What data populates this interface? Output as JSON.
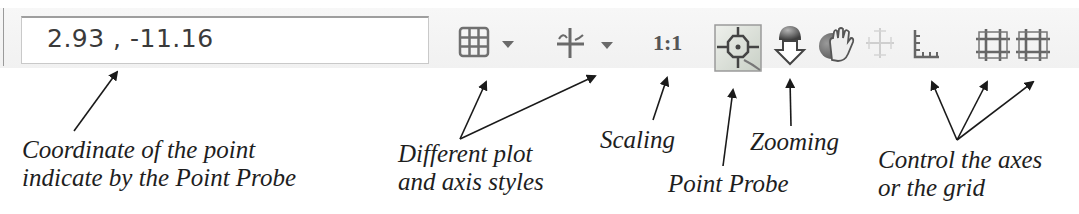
{
  "toolbar": {
    "coordinate_value": "2.93 , -11.16",
    "icons": [
      {
        "name": "plot-style-grid-icon",
        "has_dropdown": true
      },
      {
        "name": "axis-style-icon",
        "has_dropdown": true
      },
      {
        "name": "scaling-1-1-icon",
        "text": "1:1"
      },
      {
        "name": "point-probe-icon",
        "active": true
      },
      {
        "name": "zoom-icon"
      },
      {
        "name": "pan-hand-icon"
      },
      {
        "name": "pan-axes-icon",
        "disabled": true
      },
      {
        "name": "axes-ticks-icon"
      },
      {
        "name": "grid-major-icon"
      },
      {
        "name": "grid-minor-icon"
      }
    ],
    "scaling_text": "1:1"
  },
  "annotations": {
    "coordinate": {
      "line1": "Coordinate of the point",
      "line2": "indicate by the Point Probe"
    },
    "styles": {
      "line1": "Different plot",
      "line2": "and axis styles"
    },
    "scaling": {
      "line1": "Scaling"
    },
    "point_probe": {
      "line1": "Point Probe"
    },
    "zooming": {
      "line1": "Zooming"
    },
    "axes_grid": {
      "line1": "Control the axes",
      "line2": "or the grid"
    }
  },
  "colors": {
    "toolbar_bg": "#f3f3f3",
    "icon_gray": "#6f6f6f",
    "active_bg": "#d9e0d6",
    "arrow": "#1a1a1a"
  }
}
